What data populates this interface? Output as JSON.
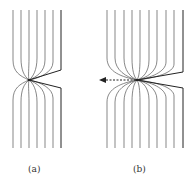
{
  "panels": [
    {
      "id": "a",
      "caption": "(a)"
    },
    {
      "id": "b",
      "caption": "(b)"
    }
  ],
  "colors": {
    "line": "#555555",
    "notch": "#222222",
    "arrow": "#222222"
  }
}
